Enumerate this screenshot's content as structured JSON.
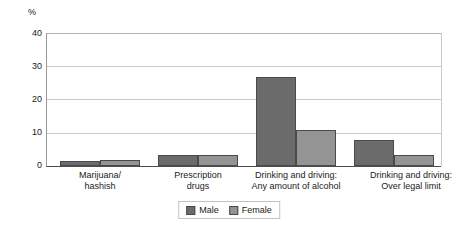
{
  "chart_data": {
    "type": "bar",
    "title": "",
    "subtitle": "",
    "xlabel": "",
    "ylabel": "%",
    "ylim": [
      0,
      40
    ],
    "yticks": [
      0,
      10,
      20,
      30,
      40
    ],
    "ytick_labels": [
      "0",
      "10",
      "20",
      "30",
      "40"
    ],
    "grid": true,
    "legend_position": "bottom-center",
    "categories": [
      "Marijuana/\nhashish",
      "Prescription\ndrugs",
      "Drinking and driving:\nAny amount of alcohol",
      "Drinking and driving:\nOver legal limit"
    ],
    "category_lines": [
      [
        "Marijuana/",
        "hashish"
      ],
      [
        "Prescription",
        "drugs"
      ],
      [
        "Drinking and driving:",
        "Any amount of alcohol"
      ],
      [
        "Drinking and driving:",
        "Over legal limit"
      ]
    ],
    "series": [
      {
        "name": "Male",
        "color": "#6b6b6b",
        "values": [
          1.6,
          3.4,
          26.7,
          7.8
        ]
      },
      {
        "name": "Female",
        "color": "#949494",
        "values": [
          1.9,
          3.3,
          10.8,
          3.4
        ]
      }
    ]
  },
  "legend": {
    "items": [
      {
        "label": "Male",
        "color": "#6b6b6b"
      },
      {
        "label": "Female",
        "color": "#949494"
      }
    ]
  },
  "colors": {
    "male": "#6b6b6b",
    "female": "#949494",
    "grid": "#c9c9c9",
    "axis": "#4d4d4d",
    "text": "#1a1a1a",
    "background": "#ffffff"
  }
}
